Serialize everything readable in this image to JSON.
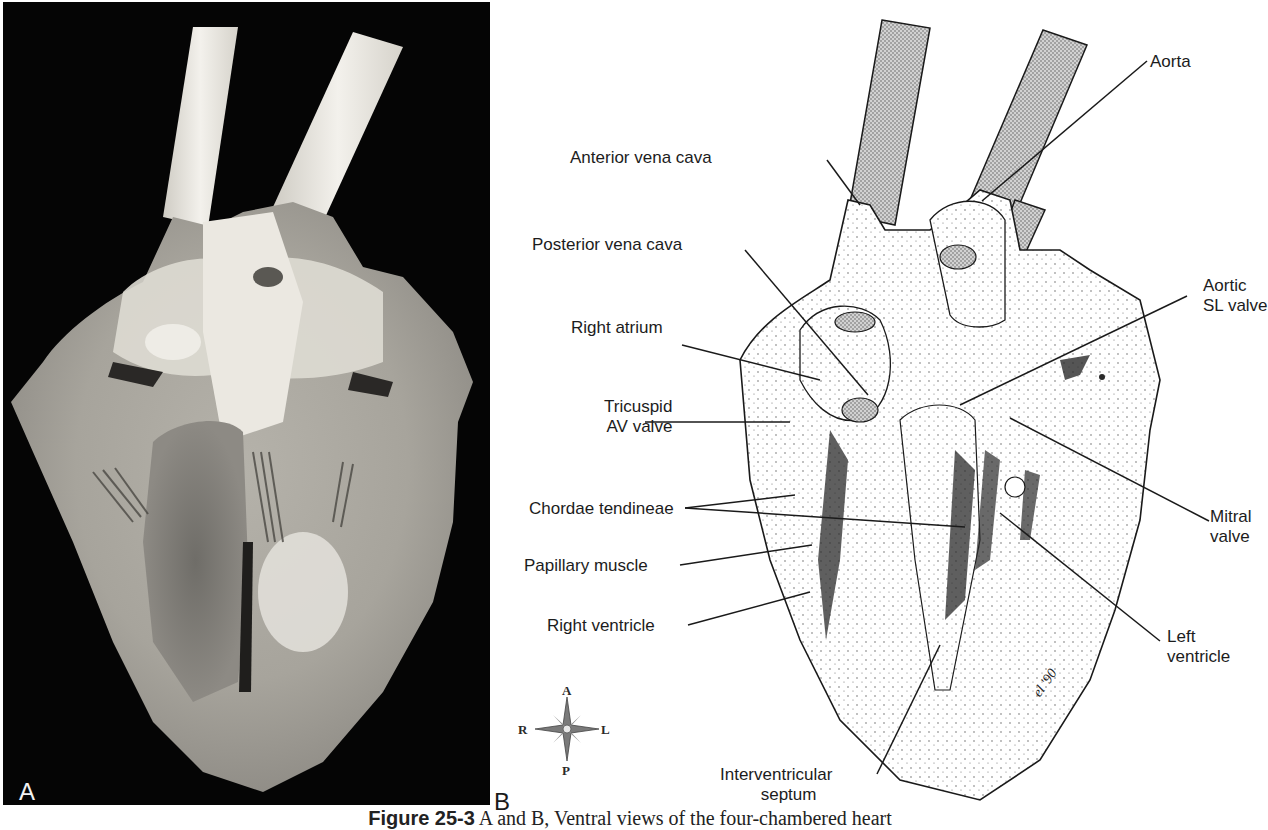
{
  "figure": {
    "caption_lead": "Figure 25-3",
    "caption_text": " A and B, Ventral views of the four-chambered heart",
    "colors": {
      "photo_background": "#050505",
      "tissue_light": "#e9e6df",
      "tissue_mid": "#b9b6ae",
      "tissue_dark": "#6e6c68",
      "vessel_fill": "#cfcfcf",
      "ink": "#1c1c1c"
    }
  },
  "panel_a": {
    "letter": "A",
    "description": "Photograph of dissected heart, ventral view, with two vessel tubes inserted"
  },
  "panel_b": {
    "letter": "B",
    "signature": "el '90",
    "labels": {
      "anterior_vena_cava": "Anterior vena cava",
      "posterior_vena_cava": "Posterior vena cava",
      "right_atrium": "Right atrium",
      "tricuspid_line1": "Tricuspid",
      "tricuspid_line2": "AV valve",
      "chordae_tendineae": "Chordae tendineae",
      "papillary_muscle": "Papillary muscle",
      "right_ventricle": "Right ventricle",
      "interventricular_line1": "Interventricular",
      "interventricular_line2": "septum",
      "aorta": "Aorta",
      "aortic_line1": "Aortic",
      "aortic_line2": "SL valve",
      "mitral_line1": "Mitral",
      "mitral_line2": "valve",
      "left_ventricle_line1": "Left",
      "left_ventricle_line2": "ventricle"
    },
    "compass": {
      "top": "A",
      "bottom": "P",
      "left": "R",
      "right": "L"
    }
  }
}
